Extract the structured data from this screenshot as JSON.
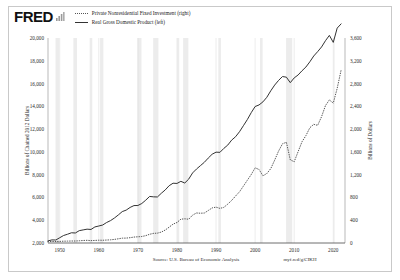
{
  "brand": {
    "logo_text": "FRED",
    "logo_icon": "bar-chart-icon"
  },
  "legend": {
    "position": "top-left",
    "items": [
      {
        "label": "Private Nonresidential Fixed Investment (right)",
        "style": "dotted",
        "color": "#555555",
        "axis": "right"
      },
      {
        "label": "Real Gross Domestic Product (left)",
        "style": "solid",
        "color": "#333333",
        "axis": "left"
      }
    ]
  },
  "footer": {
    "source": "Source: U.S. Bureau of Economic Analysis",
    "permalink": "myf.red/g/CIKH"
  },
  "chart_data": {
    "type": "line",
    "title": "",
    "xlabel": "",
    "ylabel": "Billions of Chained 2012 Dollars",
    "y2label": "Billions of Dollars",
    "xlim": [
      1947,
      2023
    ],
    "ylim": [
      2000,
      20000
    ],
    "y2lim": [
      0,
      3600
    ],
    "grid": "vertical",
    "legend_position": "top-left",
    "xticks": [
      1950,
      1960,
      1970,
      1980,
      1990,
      2000,
      2010,
      2020
    ],
    "xticklabels": [
      "1950",
      "1960",
      "1970",
      "1980",
      "1990",
      "2000",
      "2010",
      "2020"
    ],
    "yticks": [
      2000,
      4000,
      6000,
      8000,
      10000,
      12000,
      14000,
      16000,
      18000,
      20000
    ],
    "yticklabels": [
      "2,000",
      "4,000",
      "6,000",
      "8,000",
      "10,000",
      "12,000",
      "14,000",
      "16,000",
      "18,000",
      "20,000"
    ],
    "y2ticks": [
      0,
      400,
      800,
      1200,
      1600,
      2000,
      2400,
      2800,
      3200,
      3600
    ],
    "y2ticklabels": [
      "0",
      "400",
      "800",
      "1,200",
      "1,600",
      "2,000",
      "2,400",
      "2,800",
      "3,200",
      "3,600"
    ],
    "recessions": [
      [
        1948.92,
        1949.83
      ],
      [
        1953.5,
        1954.42
      ],
      [
        1957.67,
        1958.33
      ],
      [
        1960.33,
        1961.17
      ],
      [
        1969.92,
        1970.92
      ],
      [
        1973.92,
        1975.25
      ],
      [
        1980.08,
        1980.58
      ],
      [
        1981.58,
        1982.92
      ],
      [
        1990.58,
        1991.25
      ],
      [
        2001.25,
        2001.92
      ],
      [
        2007.92,
        2009.5
      ],
      [
        2020.08,
        2020.33
      ]
    ],
    "series": [
      {
        "name": "Real Gross Domestic Product (left)",
        "axis": "left",
        "style": "solid",
        "color": "#333333",
        "x": [
          1947,
          1948,
          1949,
          1950,
          1951,
          1952,
          1953,
          1954,
          1955,
          1956,
          1957,
          1958,
          1959,
          1960,
          1961,
          1962,
          1963,
          1964,
          1965,
          1966,
          1967,
          1968,
          1969,
          1970,
          1971,
          1972,
          1973,
          1974,
          1975,
          1976,
          1977,
          1978,
          1979,
          1980,
          1981,
          1982,
          1983,
          1984,
          1985,
          1986,
          1987,
          1988,
          1989,
          1990,
          1991,
          1992,
          1993,
          1994,
          1995,
          1996,
          1997,
          1998,
          1999,
          2000,
          2001,
          2002,
          2003,
          2004,
          2005,
          2006,
          2007,
          2008,
          2009,
          2010,
          2011,
          2012,
          2013,
          2014,
          2015,
          2016,
          2017,
          2018,
          2019,
          2020,
          2021,
          2022
        ],
        "values": [
          2182,
          2273,
          2263,
          2463,
          2660,
          2769,
          2897,
          2879,
          3084,
          3150,
          3215,
          3188,
          3409,
          3493,
          3580,
          3799,
          3965,
          4195,
          4465,
          4759,
          4886,
          5122,
          5285,
          5294,
          5468,
          5757,
          6088,
          6054,
          6042,
          6368,
          6661,
          7030,
          7250,
          7230,
          7414,
          7268,
          7607,
          8151,
          8496,
          8790,
          9084,
          9456,
          9795,
          9976,
          9961,
          10310,
          10598,
          11035,
          11332,
          11771,
          12298,
          12834,
          13441,
          13983,
          14122,
          14391,
          14796,
          15362,
          15866,
          16276,
          16616,
          16561,
          16079,
          16497,
          16755,
          17122,
          17451,
          17910,
          18420,
          18800,
          19213,
          19760,
          20230,
          19614,
          20868,
          21239
        ],
        "note": "Annual real GDP, billions of chained 2012 dollars; COVID dip in 2020"
      },
      {
        "name": "Private Nonresidential Fixed Investment (right)",
        "axis": "right",
        "style": "dotted",
        "color": "#555555",
        "x": [
          1947,
          1948,
          1949,
          1950,
          1951,
          1952,
          1953,
          1954,
          1955,
          1956,
          1957,
          1958,
          1959,
          1960,
          1961,
          1962,
          1963,
          1964,
          1965,
          1966,
          1967,
          1968,
          1969,
          1970,
          1971,
          1972,
          1973,
          1974,
          1975,
          1976,
          1977,
          1978,
          1979,
          1980,
          1981,
          1982,
          1983,
          1984,
          1985,
          1986,
          1987,
          1988,
          1989,
          1990,
          1991,
          1992,
          1993,
          1994,
          1995,
          1996,
          1997,
          1998,
          1999,
          2000,
          2001,
          2002,
          2003,
          2004,
          2005,
          2006,
          2007,
          2008,
          2009,
          2010,
          2011,
          2012,
          2013,
          2014,
          2015,
          2016,
          2017,
          2018,
          2019,
          2020,
          2021,
          2022
        ],
        "values": [
          24,
          27,
          26,
          28,
          32,
          33,
          35,
          35,
          39,
          44,
          47,
          42,
          45,
          49,
          48,
          52,
          56,
          63,
          74,
          85,
          86,
          93,
          104,
          109,
          114,
          129,
          153,
          169,
          173,
          192,
          228,
          278,
          331,
          360,
          418,
          425,
          417,
          490,
          527,
          523,
          526,
          570,
          616,
          630,
          608,
          626,
          683,
          748,
          825,
          899,
          999,
          1101,
          1202,
          1320,
          1291,
          1180,
          1220,
          1306,
          1455,
          1614,
          1742,
          1769,
          1461,
          1427,
          1604,
          1778,
          1886,
          2024,
          2084,
          2066,
          2218,
          2413,
          2512,
          2457,
          2716,
          3035
        ],
        "note": "Annual nonresidential fixed investment, billions of dollars; dips in 2001-03, 2009, 2020"
      }
    ]
  }
}
